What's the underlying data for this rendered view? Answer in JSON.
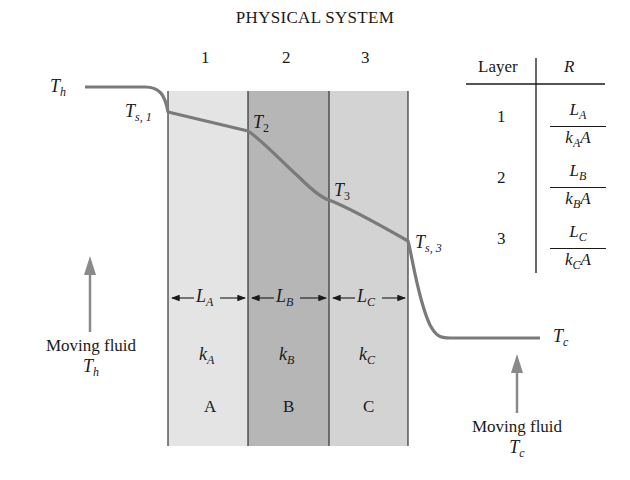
{
  "title": "PHYSICAL SYSTEM",
  "layers": [
    {
      "number": "1",
      "L_label": "L",
      "L_sub": "A",
      "k_label": "k",
      "k_sub": "A",
      "material": "A",
      "color": "#e4e4e4"
    },
    {
      "number": "2",
      "L_label": "L",
      "L_sub": "B",
      "k_label": "k",
      "k_sub": "B",
      "material": "B",
      "color": "#b6b6b6"
    },
    {
      "number": "3",
      "L_label": "L",
      "L_sub": "C",
      "k_label": "k",
      "k_sub": "C",
      "material": "C",
      "color": "#d3d3d3"
    }
  ],
  "temperatures": {
    "hot": {
      "main": "T",
      "sub": "h"
    },
    "surface1": {
      "main": "T",
      "sub": "s, 1"
    },
    "t2": {
      "main": "T",
      "sub": "2"
    },
    "t3": {
      "main": "T",
      "sub": "3"
    },
    "surface3": {
      "main": "T",
      "sub": "s, 3"
    },
    "cold": {
      "main": "T",
      "sub": "c"
    }
  },
  "fluids": {
    "hot": {
      "label": "Moving fluid",
      "temp_main": "T",
      "temp_sub": "h"
    },
    "cold": {
      "label": "Moving fluid",
      "temp_main": "T",
      "temp_sub": "c"
    }
  },
  "resistance_table": {
    "headers": [
      "Layer",
      "R"
    ],
    "rows": [
      {
        "layer": "1",
        "numerator": "L",
        "num_sub": "A",
        "denominator": "k",
        "den_sub": "A",
        "den_tail": "A"
      },
      {
        "layer": "2",
        "numerator": "L",
        "num_sub": "B",
        "denominator": "k",
        "den_sub": "B",
        "den_tail": "A"
      },
      {
        "layer": "3",
        "numerator": "L",
        "num_sub": "C",
        "denominator": "k",
        "den_sub": "C",
        "den_tail": "A"
      }
    ]
  },
  "colors": {
    "curve": "#7a7a7a",
    "arrow": "#8a8a8a",
    "line": "#333333"
  }
}
